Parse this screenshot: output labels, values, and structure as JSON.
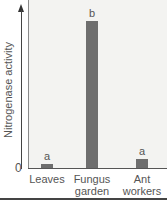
{
  "chart_data": {
    "type": "bar",
    "title": "",
    "xlabel": "",
    "ylabel": "Nitrogenase activity",
    "categories": [
      "Leaves",
      "Fungus garden",
      "Ant workers"
    ],
    "values": [
      3,
      100,
      6
    ],
    "significance_letters": [
      "a",
      "b",
      "a"
    ],
    "y_tick_labels": [
      "0"
    ],
    "ylim": [
      0,
      105
    ],
    "grid": false,
    "legend": null,
    "bar_color": "#6e6e6e",
    "units_note": "relative (no numeric scale shown)"
  },
  "axis": {
    "zero_label": "0",
    "ylabel": "Nitrogenase activity"
  },
  "bars": [
    {
      "label_line1": "Leaves",
      "label_line2": "",
      "letter": "a"
    },
    {
      "label_line1": "Fungus",
      "label_line2": "garden",
      "letter": "b"
    },
    {
      "label_line1": "Ant",
      "label_line2": "workers",
      "letter": "a"
    }
  ]
}
